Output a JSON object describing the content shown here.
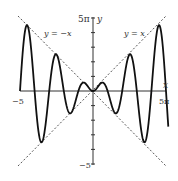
{
  "chart_data": {
    "type": "line",
    "title": "",
    "function": "y = x sin x",
    "xlabel": "x",
    "ylabel": "y",
    "xlim": [
      -15.708,
      15.708
    ],
    "ylim": [
      -15.708,
      15.708
    ],
    "x_tick_labels": {
      "left": "−5",
      "right": "5π"
    },
    "y_tick_labels": {
      "top": "5π",
      "bottom": "−5"
    },
    "y_tick_spacing": "pi",
    "grid": false,
    "legend": null,
    "series": [
      {
        "name": "y = x sin x",
        "style": "solid",
        "color": "#111111",
        "x_range": [
          -15.708,
          16.2
        ]
      },
      {
        "name": "y = x",
        "style": "dashed",
        "color": "#555555",
        "label": "y = x"
      },
      {
        "name": "y = -x",
        "style": "dashed",
        "color": "#555555",
        "label": "y = −x"
      }
    ],
    "annotations": [
      {
        "text": "y = −x",
        "near": "upper-left"
      },
      {
        "text": "y = x",
        "near": "upper-right"
      }
    ]
  },
  "labels": {
    "y_top": "5π",
    "y_axis": "y",
    "y_bottom": "−5",
    "x_left": "−5",
    "x_right": "5π",
    "x_axis": "x",
    "line_neg": "y = −x",
    "line_pos": "y = x"
  },
  "colors": {
    "curve": "#111111",
    "axes": "#333333",
    "dashed": "#555555",
    "background": "#ffffff"
  }
}
